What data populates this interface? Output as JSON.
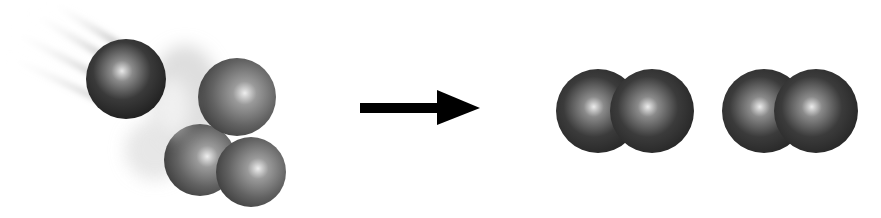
{
  "diagram": {
    "title": "",
    "reactants": {
      "incoming_atom": {
        "label": "",
        "color": "#2e2e2e"
      },
      "molecule": {
        "label": "",
        "atom_count": 3,
        "color": "#5a5a5a"
      }
    },
    "arrow": {
      "icon": "right-arrow",
      "color": "#000000"
    },
    "products": [
      {
        "label": "",
        "atom_count": 2,
        "color": "#2f2f2f"
      },
      {
        "label": "",
        "atom_count": 2,
        "color": "#2f2f2f"
      }
    ],
    "colors": {
      "background": "#ffffff",
      "highlight": "#e6e6e6",
      "motion_blur": "#bdbdbd"
    }
  }
}
